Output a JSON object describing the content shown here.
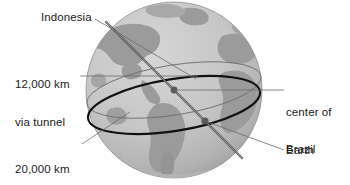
{
  "figure": {
    "background_color": "#ffffff",
    "text_color": "#1a1a1a"
  },
  "globe": {
    "name": "earth-globe",
    "center_x": 174,
    "center_y": 90,
    "radius": 88,
    "ocean_color": "#c9c9c9",
    "land_color": "#9a9a9a",
    "outline_color": "#8c8c8c"
  },
  "markers": [
    {
      "id": "center-of-earth",
      "label": "center of Earth",
      "x": 174,
      "y": 90,
      "color": "#5a5a5a"
    },
    {
      "id": "brazil",
      "label": "Brazil",
      "x": 205,
      "y": 121,
      "color": "#5a5a5a"
    }
  ],
  "labels": {
    "indonesia": "Indonesia",
    "tunnel_line1": "12,000 km",
    "tunnel_line2": "via tunnel",
    "circle_line1": "20,000 km",
    "circle_line2": "via circle",
    "center_line1": "center of",
    "center_line2": "Earth",
    "brazil": "Brazil"
  },
  "annotations": {
    "tunnel_distance": "12,000 km",
    "tunnel_method": "via tunnel",
    "circle_distance": "20,000 km",
    "circle_method": "via circle",
    "endpoint_near": "Indonesia",
    "endpoint_far": "Brazil",
    "center_point": "center of Earth"
  },
  "lines": {
    "great_circle_color": "#111111",
    "thin_circle_color": "#707070",
    "tunnel_color": "#4a4a4a",
    "leader_color": "#6b6b6b"
  }
}
